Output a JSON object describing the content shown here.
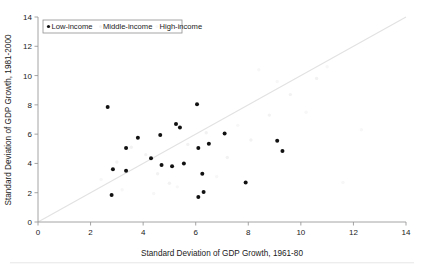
{
  "chart_data": {
    "type": "scatter",
    "title": "",
    "xlabel": "Standard Deviation of GDP Growth, 1961-80",
    "ylabel": "Standard Deviation of GDP Growth, 1981-2000",
    "xlim": [
      0,
      14
    ],
    "ylim": [
      0,
      14
    ],
    "xticks": [
      0,
      2,
      4,
      6,
      8,
      10,
      12,
      14
    ],
    "yticks": [
      0,
      2,
      4,
      6,
      8,
      10,
      12,
      14
    ],
    "xtick_labels": [
      "0",
      "2",
      "4",
      "6",
      "8",
      "10",
      "12",
      "14"
    ],
    "ytick_labels": [
      "0",
      "2",
      "4",
      "6",
      "8",
      "10",
      "12",
      "14"
    ],
    "grid": false,
    "legend_position": "top-left",
    "reference_line": {
      "name": "45-degree line",
      "from": [
        0,
        0
      ],
      "to": [
        14,
        14
      ],
      "color": "#e2e2e2"
    },
    "legend": [
      {
        "label": "Low-income",
        "marker": "filled-circle",
        "color": "#111111"
      },
      {
        "label": "Middle-income",
        "marker": "faint-circle",
        "color": "#f2f2f2"
      },
      {
        "label": "High-income",
        "marker": "faint-circle",
        "color": "#f7f7f7"
      }
    ],
    "series": [
      {
        "name": "Low-income",
        "color": "#111111",
        "points": [
          [
            2.65,
            7.85
          ],
          [
            2.8,
            1.85
          ],
          [
            2.85,
            3.6
          ],
          [
            3.35,
            3.5
          ],
          [
            3.35,
            5.05
          ],
          [
            3.8,
            5.75
          ],
          [
            4.3,
            4.35
          ],
          [
            4.65,
            5.95
          ],
          [
            4.7,
            3.9
          ],
          [
            5.1,
            3.8
          ],
          [
            5.25,
            6.7
          ],
          [
            5.4,
            6.45
          ],
          [
            5.55,
            4.0
          ],
          [
            6.05,
            8.05
          ],
          [
            6.1,
            5.05
          ],
          [
            6.1,
            1.7
          ],
          [
            6.25,
            3.3
          ],
          [
            6.3,
            2.05
          ],
          [
            6.5,
            5.35
          ],
          [
            7.1,
            6.05
          ],
          [
            7.9,
            2.7
          ],
          [
            9.1,
            5.55
          ],
          [
            9.3,
            4.85
          ]
        ]
      },
      {
        "name": "Middle-income",
        "color": "#f2f2f2",
        "points": [
          [
            3.0,
            4.1
          ],
          [
            3.55,
            5.1
          ],
          [
            4.1,
            4.6
          ],
          [
            4.55,
            3.3
          ],
          [
            5.0,
            2.65
          ],
          [
            5.7,
            5.3
          ],
          [
            6.4,
            6.1
          ],
          [
            7.2,
            4.4
          ],
          [
            8.1,
            5.6
          ],
          [
            8.8,
            7.3
          ],
          [
            9.6,
            8.7
          ],
          [
            10.6,
            9.8
          ]
        ]
      },
      {
        "name": "High-income",
        "color": "#f7f7f7",
        "points": [
          [
            2.4,
            2.9
          ],
          [
            3.2,
            2.2
          ],
          [
            4.4,
            1.95
          ],
          [
            5.3,
            2.4
          ],
          [
            6.8,
            3.1
          ],
          [
            7.6,
            6.6
          ],
          [
            8.4,
            10.4
          ],
          [
            9.1,
            9.6
          ],
          [
            10.2,
            7.5
          ],
          [
            11.0,
            10.6
          ],
          [
            11.6,
            2.7
          ],
          [
            12.3,
            6.3
          ]
        ]
      }
    ]
  }
}
